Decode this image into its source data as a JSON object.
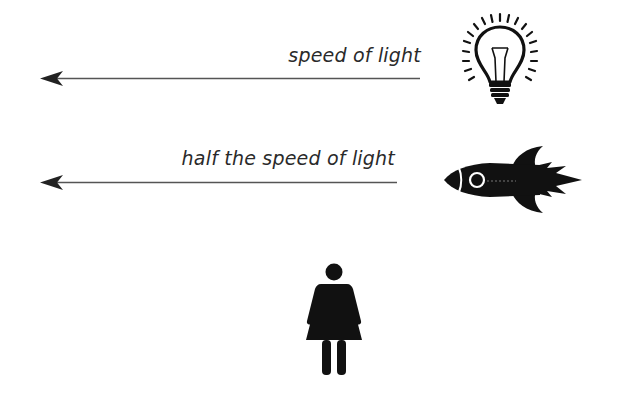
{
  "diagram": {
    "rows": [
      {
        "id": "light",
        "label": "speed of light",
        "source_icon": "lightbulb-icon",
        "arrow_direction": "left"
      },
      {
        "id": "rocket",
        "label": "half the speed of light",
        "source_icon": "rocket-icon",
        "arrow_direction": "left"
      }
    ],
    "observer_icon": "woman-figure-icon",
    "colors": {
      "background": "#ffffff",
      "ink": "#111111",
      "arrow": "#555555",
      "text": "#2a2a2a"
    }
  }
}
